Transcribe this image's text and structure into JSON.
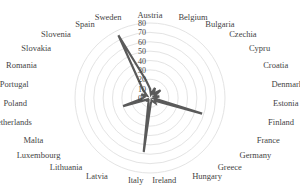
{
  "chart_data": {
    "type": "radar",
    "title": "",
    "categories": [
      "Austria",
      "Belgium",
      "Bulgaria",
      "Czechia",
      "Cypru",
      "Croatia",
      "Denmark",
      "Estonia",
      "Finland",
      "France",
      "Germany",
      "Greece",
      "Hungary",
      "Ireland",
      "Italy",
      "Latvia",
      "Lithuania",
      "Luxembourg",
      "Malta",
      "Netherlands",
      "Poland",
      "Portugal",
      "Romania",
      "Slovakia",
      "Slovenia",
      "Spain",
      "Sweden"
    ],
    "series": [
      {
        "name": "Series 1",
        "color": "#5a5a5a",
        "values": [
          10,
          4,
          12,
          6,
          14,
          5,
          10,
          4,
          58,
          6,
          8,
          3,
          4,
          6,
          58,
          5,
          3,
          4,
          3,
          30,
          8,
          6,
          10,
          4,
          12,
          75,
          20
        ]
      }
    ],
    "radial_ticks": [
      0,
      10,
      20,
      30,
      40,
      50,
      60,
      70,
      80
    ],
    "rlim": [
      0,
      80
    ],
    "grid": true,
    "legend": "none"
  }
}
